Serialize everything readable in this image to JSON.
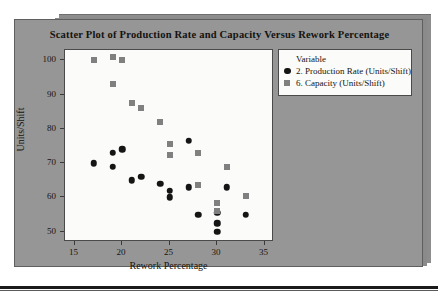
{
  "figure": {
    "panel_color": "#969696",
    "plot_background": "#fbfbf9"
  },
  "legend": {
    "title": "Variable",
    "entries": [
      {
        "label": "2. Production Rate (Units/Shift)",
        "marker": "circle",
        "color": "#151515"
      },
      {
        "label": "6. Capacity (Units/Shift)",
        "marker": "square",
        "color": "#808080"
      }
    ]
  },
  "chart_data": {
    "type": "scatter",
    "title": "Scatter Plot of Production Rate and Capacity Versus Rework Percentage",
    "xlabel": "Rework Percentage",
    "ylabel": "Units/Shift",
    "xlim": [
      14.0,
      36.0
    ],
    "ylim": [
      47.0,
      103.0
    ],
    "xticks": [
      15,
      20,
      25,
      30,
      35
    ],
    "yticks": [
      50,
      60,
      70,
      80,
      90,
      100
    ],
    "grid": false,
    "legend_position": "right",
    "series": [
      {
        "name": "2. Production Rate (Units/Shift)",
        "marker": "circle",
        "color": "#151515",
        "points": [
          [
            17,
            70.0
          ],
          [
            19,
            73.0
          ],
          [
            19,
            69.0
          ],
          [
            20,
            74.0
          ],
          [
            21,
            65.0
          ],
          [
            22,
            66.0
          ],
          [
            24,
            64.0
          ],
          [
            25,
            62.0
          ],
          [
            25,
            60.0
          ],
          [
            27,
            76.5
          ],
          [
            27,
            63.0
          ],
          [
            28,
            55.0
          ],
          [
            30,
            55.5
          ],
          [
            30,
            52.5
          ],
          [
            30,
            50.0
          ],
          [
            31,
            63.0
          ],
          [
            33,
            55.0
          ]
        ]
      },
      {
        "name": "6. Capacity (Units/Shift)",
        "marker": "square",
        "color": "#808080",
        "points": [
          [
            17,
            100.0
          ],
          [
            19,
            101.0
          ],
          [
            19,
            93.0
          ],
          [
            20,
            100.0
          ],
          [
            21,
            87.5
          ],
          [
            22,
            86.0
          ],
          [
            24,
            82.0
          ],
          [
            25,
            75.5
          ],
          [
            25,
            72.5
          ],
          [
            28,
            73.0
          ],
          [
            28,
            63.5
          ],
          [
            30,
            58.5
          ],
          [
            30,
            56.0
          ],
          [
            31,
            69.0
          ],
          [
            33,
            60.5
          ]
        ]
      }
    ]
  }
}
